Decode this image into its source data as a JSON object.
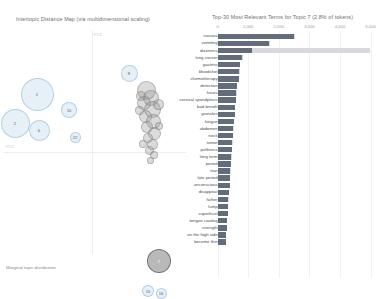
{
  "left_panel": {
    "title": "Intertopic Distance Map (via multidimensional scaling)",
    "axis_x_label": "PC1",
    "axis_y_label": "PC2",
    "legend": {
      "title": "Marginal topic distribution"
    },
    "topics": [
      {
        "label": "1",
        "x": 37,
        "y": 68,
        "r": 16.5,
        "selected": false
      },
      {
        "label": "2",
        "x": 15,
        "y": 97,
        "r": 14.5,
        "selected": false
      },
      {
        "label": "6",
        "x": 39,
        "y": 104,
        "r": 10.5,
        "selected": false
      },
      {
        "label": "8",
        "x": 129,
        "y": 47,
        "r": 8.5,
        "selected": false
      },
      {
        "label": "10",
        "x": 69,
        "y": 84,
        "r": 8.0,
        "selected": false
      },
      {
        "label": "22",
        "x": 75,
        "y": 111,
        "r": 5.5,
        "selected": false
      },
      {
        "label": "7",
        "x": 159,
        "y": 235,
        "r": 12.0,
        "selected": true
      },
      {
        "label": "15",
        "x": 148,
        "y": 265,
        "r": 6.0,
        "selected": false
      },
      {
        "label": "16",
        "x": 161,
        "y": 267,
        "r": 5.5,
        "selected": false
      }
    ],
    "cluster_dots": [
      {
        "x": 146,
        "y": 64,
        "r": 9.5
      },
      {
        "x": 151,
        "y": 72,
        "r": 8.0
      },
      {
        "x": 144,
        "y": 77,
        "r": 7.0
      },
      {
        "x": 152,
        "y": 83,
        "r": 8.5
      },
      {
        "x": 145,
        "y": 90,
        "r": 6.5
      },
      {
        "x": 153,
        "y": 95,
        "r": 7.5
      },
      {
        "x": 147,
        "y": 101,
        "r": 6.0
      },
      {
        "x": 154,
        "y": 107,
        "r": 6.5
      },
      {
        "x": 148,
        "y": 112,
        "r": 5.0
      },
      {
        "x": 152,
        "y": 118,
        "r": 5.5
      },
      {
        "x": 149,
        "y": 124,
        "r": 4.5
      },
      {
        "x": 154,
        "y": 129,
        "r": 4.0
      },
      {
        "x": 150,
        "y": 134,
        "r": 3.5
      },
      {
        "x": 141,
        "y": 70,
        "r": 5.0
      },
      {
        "x": 158,
        "y": 78,
        "r": 5.5
      },
      {
        "x": 139,
        "y": 84,
        "r": 4.5
      },
      {
        "x": 159,
        "y": 100,
        "r": 4.0
      },
      {
        "x": 143,
        "y": 118,
        "r": 4.0
      }
    ]
  },
  "chart_data": {
    "type": "bar",
    "title": "Top-30 Most Relevant Terms for Topic 7 (2.8% of tokens)",
    "topic": "7",
    "topic_share": "2.8% of tokens",
    "xlabel": "",
    "ylabel": "",
    "xlim": [
      0,
      5000
    ],
    "grid": true,
    "ticks": [
      "0",
      "1,000",
      "2,000",
      "3,000",
      "4,000",
      "5,000"
    ],
    "tick_values": [
      0,
      1000,
      2000,
      3000,
      4000,
      5000
    ],
    "legend": {
      "position": "none",
      "entries": [
        {
          "name": "Overall term frequency",
          "color": "#d8d9dd"
        },
        {
          "name": "Estimated term frequency within the selected topic",
          "color": "#636c7a"
        }
      ]
    },
    "categories": [
      "nausea",
      "vomiting",
      "dizziness",
      "lung cancer",
      "gastritis",
      "bloodshot",
      "chemotherapy",
      "detection",
      "hours",
      "cervical spondylosis",
      "bad breath",
      "granules",
      "fatigue",
      "abdomen",
      "neck",
      "tumor",
      "puffiness",
      "long term",
      "period",
      "tear",
      "late period",
      "unconscious",
      "disappear",
      "father",
      "lump",
      "superficial",
      "tongue coating",
      "strength",
      "on the high side",
      "become thin"
    ],
    "series": [
      {
        "name": "Overall term frequency",
        "color": "#d8d9dd",
        "values": [
          2520,
          1710,
          4980,
          820,
          740,
          720,
          700,
          640,
          620,
          600,
          580,
          560,
          540,
          520,
          500,
          490,
          470,
          455,
          440,
          425,
          410,
          395,
          380,
          360,
          345,
          330,
          315,
          300,
          285,
          270
        ]
      },
      {
        "name": "Estimated term frequency within the selected topic",
        "color": "#636c7a",
        "values": [
          2510,
          1690,
          1130,
          810,
          735,
          715,
          695,
          635,
          615,
          595,
          575,
          555,
          535,
          515,
          495,
          485,
          465,
          450,
          435,
          420,
          405,
          390,
          375,
          355,
          340,
          325,
          310,
          295,
          280,
          265
        ]
      }
    ]
  }
}
